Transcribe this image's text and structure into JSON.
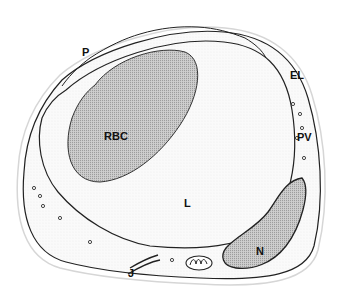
{
  "figure": {
    "labels": {
      "P": "P",
      "EL": "EL",
      "PV": "PV",
      "RBC": "RBC",
      "L": "L",
      "N": "N",
      "J": "J"
    },
    "colors": {
      "outline": "#222222",
      "stipple_light": "#f1f1f1",
      "stipple_dark": "#b8b8b8",
      "background": "#ffffff"
    }
  }
}
